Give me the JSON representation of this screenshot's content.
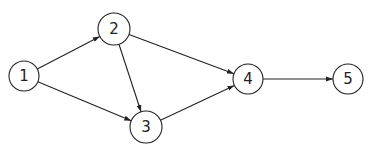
{
  "graph": {
    "type": "directed",
    "nodes": [
      {
        "id": "1",
        "label": "1",
        "x": 24,
        "y": 76,
        "r": 15
      },
      {
        "id": "2",
        "label": "2",
        "x": 114,
        "y": 29,
        "r": 16
      },
      {
        "id": "3",
        "label": "3",
        "x": 146,
        "y": 127,
        "r": 16
      },
      {
        "id": "4",
        "label": "4",
        "x": 248,
        "y": 79,
        "r": 15
      },
      {
        "id": "5",
        "label": "5",
        "x": 348,
        "y": 79,
        "r": 15
      }
    ],
    "edges": [
      {
        "from": "1",
        "to": "2"
      },
      {
        "from": "1",
        "to": "3"
      },
      {
        "from": "2",
        "to": "3"
      },
      {
        "from": "2",
        "to": "4"
      },
      {
        "from": "3",
        "to": "4"
      },
      {
        "from": "4",
        "to": "5"
      }
    ]
  },
  "colors": {
    "stroke": "#222222",
    "background": "#ffffff"
  }
}
